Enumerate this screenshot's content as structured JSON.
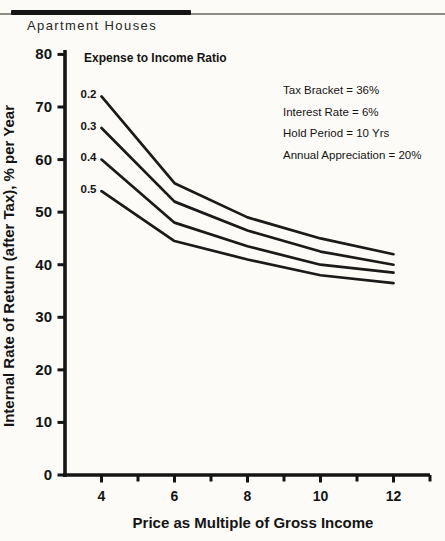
{
  "header": {
    "title": "Apartment Houses"
  },
  "chart_data": {
    "type": "line",
    "title": "Apartment Houses",
    "xlabel": "Price as Multiple of Gross Income",
    "ylabel": "Internal Rate of Return (after Tax), % per Year",
    "xlim": [
      3,
      13
    ],
    "ylim": [
      0,
      80
    ],
    "x_ticks_major": [
      4,
      6,
      8,
      10,
      12
    ],
    "x_ticks_minor": [
      5,
      7,
      9,
      11,
      13
    ],
    "y_ticks": [
      0,
      10,
      20,
      30,
      40,
      50,
      60,
      70,
      80
    ],
    "grid": false,
    "legend_heading": "Expense to Income Ratio",
    "line_color": "#1a1a1a",
    "x": [
      4,
      6,
      8,
      10,
      12
    ],
    "series": [
      {
        "name": "0.2",
        "values": [
          72,
          55.5,
          49,
          45,
          42
        ]
      },
      {
        "name": "0.3",
        "values": [
          66,
          52,
          46.5,
          42.5,
          40
        ]
      },
      {
        "name": "0.4",
        "values": [
          60,
          48,
          43.5,
          40,
          38.5
        ]
      },
      {
        "name": "0.5",
        "values": [
          54,
          44.5,
          41,
          38,
          36.5
        ]
      }
    ],
    "annotations": [
      "Tax Bracket = 36%",
      "Interest Rate = 6%",
      "Hold Period = 10 Yrs",
      "Annual Appreciation = 20%"
    ]
  }
}
